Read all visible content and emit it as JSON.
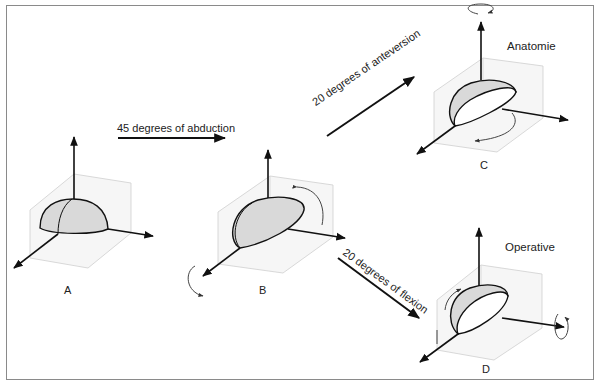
{
  "diagram": {
    "panels": [
      {
        "id": "A",
        "label": "A"
      },
      {
        "id": "B",
        "label": "B"
      },
      {
        "id": "C",
        "label": "C",
        "title": "Anatomie"
      },
      {
        "id": "D",
        "label": "D",
        "title": "Operative"
      }
    ],
    "transitions": [
      {
        "from": "A",
        "to": "B",
        "label": "45 degrees of abduction"
      },
      {
        "from": "B",
        "to": "C",
        "label": "20 degrees of anteversion"
      },
      {
        "from": "B",
        "to": "D",
        "label": "20 degrees of flexion"
      }
    ],
    "colors": {
      "frame": "#8a8a8a",
      "axis": "#111111",
      "plane": "#c8c8c8",
      "plane_fill": "#f4f4f4",
      "hemisphere_fill": "#d9d9d9",
      "opening_fill": "#ffffff"
    }
  }
}
